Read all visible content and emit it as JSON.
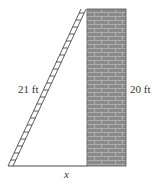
{
  "diagram": {
    "ladder_label": "21 ft",
    "wall_label": "20 ft",
    "ground_label": "x",
    "colors": {
      "wall_fill": "#8a8a8a",
      "mortar": "#b8b8b8",
      "line": "#333333"
    }
  }
}
